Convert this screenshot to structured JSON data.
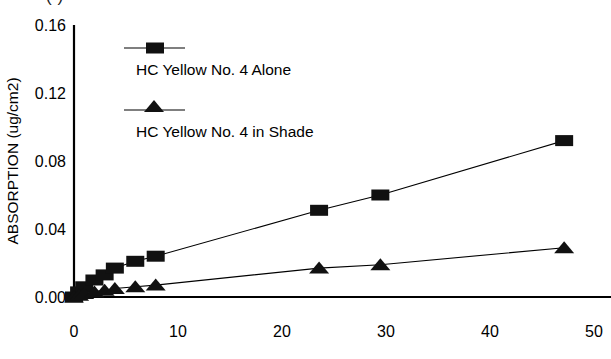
{
  "figure": {
    "caption_fragment": "(                                        )"
  },
  "chart_data": {
    "type": "line",
    "title": "",
    "xlabel": "",
    "ylabel": "ABSORPTION (ug/cm2)",
    "xlim": [
      0,
      52
    ],
    "ylim": [
      0.0,
      0.16
    ],
    "grid": false,
    "legend_position": "upper-left-inside",
    "x_ticks": [
      0,
      10,
      20,
      30,
      40,
      50
    ],
    "x_tick_labels": [
      "0",
      "10",
      "20",
      "30",
      "40",
      "50"
    ],
    "y_ticks": [
      0.0,
      0.04,
      0.08,
      0.12,
      0.16
    ],
    "y_tick_labels": [
      "0.00",
      "0.04",
      "0.08",
      "0.12",
      "0.16"
    ],
    "series": [
      {
        "name": "HC Yellow No. 4 Alone",
        "marker": "square",
        "x": [
          0,
          0.5,
          1,
          2,
          3,
          4,
          6,
          8,
          24,
          30,
          48
        ],
        "y": [
          0.0,
          0.003,
          0.006,
          0.01,
          0.013,
          0.017,
          0.021,
          0.024,
          0.051,
          0.06,
          0.092
        ]
      },
      {
        "name": "HC Yellow No. 4 in Shade",
        "marker": "triangle",
        "x": [
          0,
          0.5,
          1,
          2,
          3,
          4,
          6,
          8,
          24,
          30,
          48
        ],
        "y": [
          0.0,
          0.001,
          0.002,
          0.003,
          0.004,
          0.005,
          0.006,
          0.007,
          0.017,
          0.019,
          0.029
        ]
      }
    ]
  },
  "legend": {
    "entries": [
      {
        "label": "HC Yellow No. 4 Alone",
        "marker": "square"
      },
      {
        "label": "HC Yellow No. 4 in Shade",
        "marker": "triangle"
      }
    ]
  }
}
